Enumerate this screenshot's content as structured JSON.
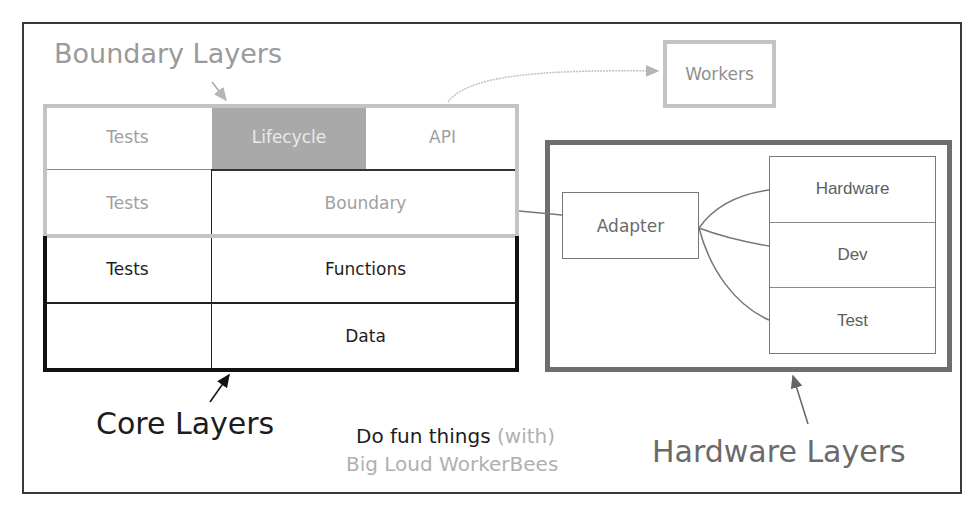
{
  "diagram": {
    "title_boundary": "Boundary Layers",
    "grid": {
      "rows": [
        [
          {
            "label": "Tests",
            "style": "grey"
          },
          {
            "label": "Lifecycle",
            "style": "lifecycle"
          },
          {
            "label": "API",
            "style": "grey"
          }
        ],
        [
          {
            "label": "Tests",
            "style": "grey"
          },
          {
            "label": "Boundary",
            "style": "grey"
          }
        ],
        [
          {
            "label": "Tests",
            "style": "dark"
          },
          {
            "label": "Functions",
            "style": "dark"
          }
        ],
        [
          {
            "label": "",
            "style": "dark"
          },
          {
            "label": "Data",
            "style": "dark"
          }
        ]
      ]
    },
    "workers": "Workers",
    "adapter": "Adapter",
    "hardware_stack": [
      "Hardware",
      "Dev",
      "Test"
    ],
    "label_core": "Core Layers",
    "label_hardware": "Hardware Layers",
    "tagline": {
      "line1_main": "Do fun things",
      "line1_aside": "(with)",
      "line2": "Big Loud WorkerBees"
    },
    "colors": {
      "boundary": "#c3c3c3",
      "core": "#111111",
      "hardware": "#6e6e6e",
      "lifecycle_fill": "#a9a9a9"
    }
  }
}
